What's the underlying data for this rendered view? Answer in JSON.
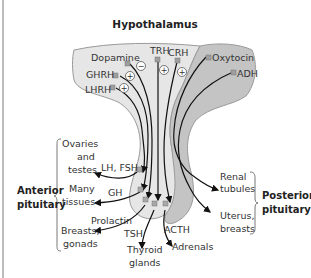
{
  "title": "Hypothalamus",
  "hypothalamus_hormones": {
    "dopamine": "Dopamine",
    "ghrh": "GHRH",
    "lhrh": "LHRH",
    "trh": "TRH",
    "crh": "CRH",
    "oxytocin": "Oxytocin",
    "adh": "ADH"
  },
  "signs": {
    "dopamine": "−",
    "ghrh": "+",
    "lhrh": "+",
    "trh": "+",
    "crh": "+"
  },
  "anterior": {
    "group_label_line1": "Anterior",
    "group_label_line2": "pituitary",
    "hormones": {
      "lh_fsh": "LH, FSH",
      "gh": "GH",
      "prolactin": "Prolactin",
      "tsh": "TSH",
      "acth": "ACTH"
    },
    "targets": {
      "ovaries_1": "Ovaries",
      "ovaries_2": "and",
      "ovaries_3": "testes",
      "many_1": "Many",
      "many_2": "tissues",
      "breasts_1": "Breasts,",
      "breasts_2": "gonads",
      "thyroid_1": "Thyroid",
      "thyroid_2": "glands",
      "adrenals": "Adrenals"
    }
  },
  "posterior": {
    "group_label_line1": "Posterior",
    "group_label_line2": "pituitary",
    "targets": {
      "renal_1": "Renal",
      "renal_2": "tubules",
      "uterus_1": "Uterus,",
      "uterus_2": "breasts"
    }
  },
  "colors": {
    "anterior_fill": "#e6e6e6",
    "posterior_fill": "#c4c4c4",
    "outline": "#9a9a9a",
    "fiber": "#111111",
    "marker": "#9e9e9e",
    "text": "#333333"
  }
}
